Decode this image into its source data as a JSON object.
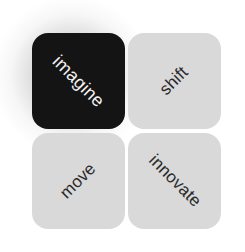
{
  "tiles": [
    {
      "label": "imagine",
      "bg": "#141414",
      "fg": "#f2f2f2",
      "rotation": 45,
      "selected": true
    },
    {
      "label": "shift",
      "bg": "#d9d9d9",
      "fg": "#2a2a2a",
      "rotation": -45,
      "selected": false
    },
    {
      "label": "move",
      "bg": "#d9d9d9",
      "fg": "#2a2a2a",
      "rotation": -45,
      "selected": false
    },
    {
      "label": "innovate",
      "bg": "#d9d9d9",
      "fg": "#2a2a2a",
      "rotation": 45,
      "selected": false
    }
  ],
  "colors": {
    "selected_tile": "#141414",
    "tile": "#d9d9d9",
    "selected_text": "#f2f2f2",
    "text": "#2a2a2a",
    "background": "#ffffff"
  }
}
